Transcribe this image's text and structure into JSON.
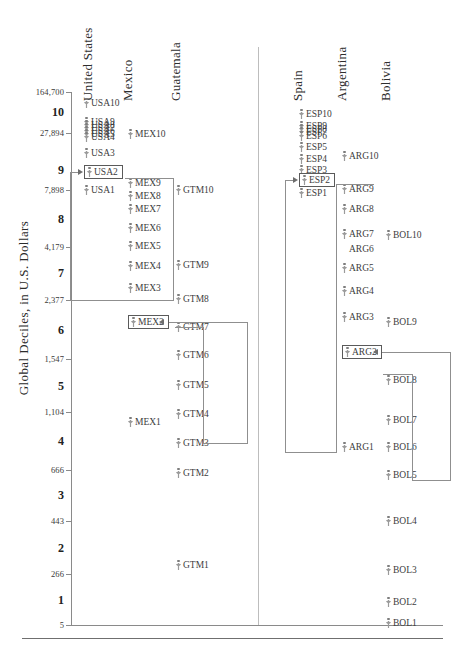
{
  "chart_data": {
    "type": "scatter",
    "title": "",
    "ylabel": "Global Deciles, in U.S. Dollars",
    "xlabel": "",
    "scale": "log",
    "ylim": [
      5,
      164700
    ],
    "grid": false,
    "legend": null,
    "axis_values": [
      {
        "label": "164,700",
        "y": 92
      },
      {
        "label": "27,894",
        "y": 133
      },
      {
        "label": "7,898",
        "y": 190
      },
      {
        "label": "4,179",
        "y": 247
      },
      {
        "label": "2,377",
        "y": 300
      },
      {
        "label": "1,547",
        "y": 359
      },
      {
        "label": "1,104",
        "y": 412
      },
      {
        "label": "666",
        "y": 470
      },
      {
        "label": "443",
        "y": 521
      },
      {
        "label": "266",
        "y": 574
      },
      {
        "label": "5",
        "y": 625
      }
    ],
    "deciles": [
      {
        "label": "10",
        "y": 112
      },
      {
        "label": "9",
        "y": 170
      },
      {
        "label": "8",
        "y": 219
      },
      {
        "label": "7",
        "y": 273
      },
      {
        "label": "6",
        "y": 330
      },
      {
        "label": "5",
        "y": 386
      },
      {
        "label": "4",
        "y": 441
      },
      {
        "label": "3",
        "y": 495
      },
      {
        "label": "2",
        "y": 548
      },
      {
        "label": "1",
        "y": 600
      }
    ],
    "columns": [
      {
        "name": "United States",
        "key": "usa",
        "header_x": 96,
        "header_y": 85,
        "point_x": 84
      },
      {
        "name": "Mexico",
        "key": "mex",
        "header_x": 136,
        "header_y": 85,
        "point_x": 128
      },
      {
        "name": "Guatemala",
        "key": "gtm",
        "header_x": 184,
        "header_y": 85,
        "point_x": 176
      },
      {
        "name": "Spain",
        "key": "esp",
        "header_x": 306,
        "header_y": 85,
        "point_x": 299
      },
      {
        "name": "Argentina",
        "key": "arg",
        "header_x": 350,
        "header_y": 85,
        "point_x": 342
      },
      {
        "name": "Bolivia",
        "key": "bol",
        "header_x": 394,
        "header_y": 85,
        "point_x": 386
      }
    ],
    "series": [
      {
        "name": "United States",
        "key": "usa",
        "points": [
          {
            "label": "USA10",
            "y": 103,
            "boxed": false,
            "glyph": true
          },
          {
            "label": "USA9",
            "y": 122,
            "boxed": false,
            "glyph": true
          },
          {
            "label": "USA8",
            "y": 125,
            "boxed": false,
            "glyph": true
          },
          {
            "label": "USA7",
            "y": 128,
            "boxed": false,
            "glyph": true
          },
          {
            "label": "USA6",
            "y": 131,
            "boxed": false,
            "glyph": true
          },
          {
            "label": "USA5",
            "y": 134,
            "boxed": false,
            "glyph": true
          },
          {
            "label": "USA4",
            "y": 137,
            "boxed": false,
            "glyph": true
          },
          {
            "label": "USA3",
            "y": 153,
            "boxed": false,
            "glyph": true
          },
          {
            "label": "USA2",
            "y": 172,
            "boxed": true,
            "glyph": true
          },
          {
            "label": "USA1",
            "y": 190,
            "boxed": false,
            "glyph": true
          }
        ]
      },
      {
        "name": "Mexico",
        "key": "mex",
        "points": [
          {
            "label": "MEX10",
            "y": 134,
            "boxed": false,
            "glyph": true
          },
          {
            "label": "MEX9",
            "y": 183,
            "boxed": false,
            "glyph": true
          },
          {
            "label": "MEX8",
            "y": 196,
            "boxed": false,
            "glyph": true
          },
          {
            "label": "MEX7",
            "y": 209,
            "boxed": false,
            "glyph": true
          },
          {
            "label": "MEX6",
            "y": 228,
            "boxed": false,
            "glyph": true
          },
          {
            "label": "MEX5",
            "y": 246,
            "boxed": false,
            "glyph": true
          },
          {
            "label": "MEX4",
            "y": 266,
            "boxed": false,
            "glyph": true
          },
          {
            "label": "MEX3",
            "y": 288,
            "boxed": false,
            "glyph": true
          },
          {
            "label": "MEX2",
            "y": 322,
            "boxed": true,
            "glyph": true
          },
          {
            "label": "MEX1",
            "y": 422,
            "boxed": false,
            "glyph": true
          }
        ]
      },
      {
        "name": "Guatemala",
        "key": "gtm",
        "points": [
          {
            "label": "GTM10",
            "y": 190,
            "boxed": false,
            "glyph": true
          },
          {
            "label": "GTM9",
            "y": 265,
            "boxed": false,
            "glyph": true
          },
          {
            "label": "GTM8",
            "y": 299,
            "boxed": false,
            "glyph": true
          },
          {
            "label": "GTM7",
            "y": 327,
            "boxed": false,
            "glyph": true
          },
          {
            "label": "GTM6",
            "y": 355,
            "boxed": false,
            "glyph": true
          },
          {
            "label": "GTM5",
            "y": 385,
            "boxed": false,
            "glyph": true
          },
          {
            "label": "GTM4",
            "y": 414,
            "boxed": false,
            "glyph": true
          },
          {
            "label": "GTM3",
            "y": 443,
            "boxed": false,
            "glyph": true
          },
          {
            "label": "GTM2",
            "y": 473,
            "boxed": false,
            "glyph": true
          },
          {
            "label": "GTM1",
            "y": 565,
            "boxed": false,
            "glyph": true
          }
        ]
      },
      {
        "name": "Spain",
        "key": "esp",
        "points": [
          {
            "label": "ESP10",
            "y": 114,
            "boxed": false,
            "glyph": true
          },
          {
            "label": "ESP9",
            "y": 126,
            "boxed": false,
            "glyph": true
          },
          {
            "label": "ESP8",
            "y": 129,
            "boxed": false,
            "glyph": true
          },
          {
            "label": "ESP7",
            "y": 132,
            "boxed": false,
            "glyph": true
          },
          {
            "label": "ESP6",
            "y": 136,
            "boxed": false,
            "glyph": true
          },
          {
            "label": "ESP5",
            "y": 147,
            "boxed": false,
            "glyph": true
          },
          {
            "label": "ESP4",
            "y": 159,
            "boxed": false,
            "glyph": true
          },
          {
            "label": "ESP3",
            "y": 170,
            "boxed": false,
            "glyph": true
          },
          {
            "label": "ESP2",
            "y": 180,
            "boxed": true,
            "glyph": true
          },
          {
            "label": "ESP1",
            "y": 193,
            "boxed": false,
            "glyph": true
          }
        ]
      },
      {
        "name": "Argentina",
        "key": "arg",
        "points": [
          {
            "label": "ARG10",
            "y": 156,
            "boxed": false,
            "glyph": true
          },
          {
            "label": "ARG9",
            "y": 189,
            "boxed": false,
            "glyph": true
          },
          {
            "label": "ARG8",
            "y": 209,
            "boxed": false,
            "glyph": true
          },
          {
            "label": "ARG7",
            "y": 234,
            "boxed": false,
            "glyph": true
          },
          {
            "label": "ARG6",
            "y": 249,
            "boxed": false,
            "glyph": false
          },
          {
            "label": "ARG5",
            "y": 268,
            "boxed": false,
            "glyph": true
          },
          {
            "label": "ARG4",
            "y": 291,
            "boxed": false,
            "glyph": true
          },
          {
            "label": "ARG3",
            "y": 317,
            "boxed": false,
            "glyph": true
          },
          {
            "label": "ARG2",
            "y": 352,
            "boxed": true,
            "glyph": true
          },
          {
            "label": "ARG1",
            "y": 447,
            "boxed": false,
            "glyph": true
          }
        ]
      },
      {
        "name": "Bolivia",
        "key": "bol",
        "points": [
          {
            "label": "BOL10",
            "y": 235,
            "boxed": false,
            "glyph": true
          },
          {
            "label": "BOL9",
            "y": 322,
            "boxed": false,
            "glyph": true
          },
          {
            "label": "BOL8",
            "y": 380,
            "boxed": false,
            "glyph": true
          },
          {
            "label": "BOL7",
            "y": 420,
            "boxed": false,
            "glyph": true
          },
          {
            "label": "BOL6",
            "y": 447,
            "boxed": false,
            "glyph": true
          },
          {
            "label": "BOL5",
            "y": 475,
            "boxed": false,
            "glyph": true
          },
          {
            "label": "BOL4",
            "y": 521,
            "boxed": false,
            "glyph": true
          },
          {
            "label": "BOL3",
            "y": 570,
            "boxed": false,
            "glyph": true
          },
          {
            "label": "BOL2",
            "y": 602,
            "boxed": false,
            "glyph": true
          },
          {
            "label": "BOL1",
            "y": 623,
            "boxed": false,
            "glyph": true
          }
        ]
      }
    ],
    "annotations": [
      {
        "name": "usa2-bracket",
        "from": "Mexico MEX3-MEX9",
        "to": "USA2"
      },
      {
        "name": "mex2-bracket",
        "from": "Guatemala GTM3-GTM7",
        "to": "MEX2"
      },
      {
        "name": "esp2-bracket",
        "from": "Argentina ARG1-ARG9",
        "to": "ESP2"
      },
      {
        "name": "arg2-bracket",
        "from": "Bolivia BOL5-BOL8",
        "to": "ARG2"
      }
    ]
  }
}
